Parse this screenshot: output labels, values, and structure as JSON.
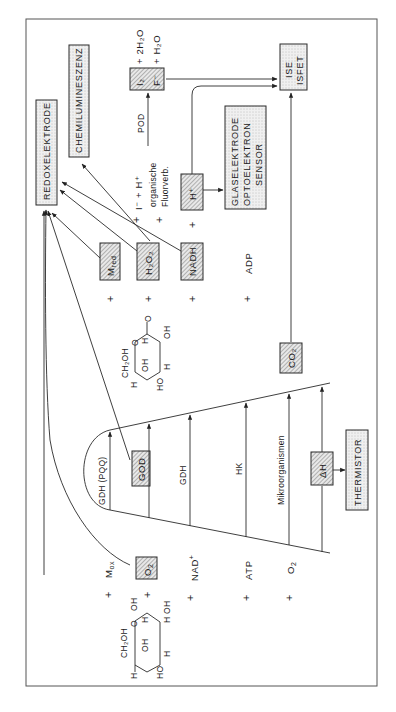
{
  "figure": {
    "orientation": "rotated -90deg (text reads bottom-to-top)",
    "detectors": {
      "redox": "REDOXELEKTRODE",
      "chemilum": "CHEMILUMINESZENZ",
      "ise_line1": "ISE",
      "ise_line2": "ISFET",
      "glas_line1": "GLASELEKTRODE",
      "glas_line2": "OPTOELEKTRON",
      "glas_line3": "SENSOR",
      "thermistor": "THERMISTOR"
    },
    "enzymes": {
      "gdh_pqq": "GDH (PQQ)",
      "god": "GOD",
      "gdh": "GDH",
      "hk": "HK",
      "micro": "Mikroorganismen",
      "pod": "POD"
    },
    "reactants": {
      "mox": "M",
      "mox_sub": "ox",
      "o2_box": "O",
      "o2_box_sub": "2",
      "nad": "NAD",
      "nad_sup": "+",
      "atp": "ATP",
      "o2": "O",
      "o2_sub": "2"
    },
    "products": {
      "mred": "M",
      "mred_sub": "red",
      "h2o2": "H₂O₂",
      "nadh": "NADH",
      "adp": "ADP",
      "co2": "CO₂",
      "dh": "ΔH",
      "hplus": "H⁺"
    },
    "secondary": {
      "iminus_hplus": "I⁻ + H⁺",
      "organische": "organische",
      "fluorverb": "Fluorverb.",
      "i2": "I₂",
      "fminus": "F⁻",
      "plus_2h2o": "+ 2H₂O",
      "plus_h2o": "+  H₂O"
    },
    "glucose": {
      "ch2oh": "CH₂OH",
      "o": "O",
      "oh": "OH",
      "h": "H",
      "ho": "HO"
    },
    "gluconolactone": {
      "ch2oh": "CH₂OH",
      "o": "O",
      "oh": "OH",
      "h": "H",
      "ho": "HO"
    },
    "plus": "+"
  }
}
